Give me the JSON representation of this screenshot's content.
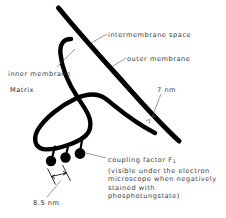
{
  "figure": {
    "background_color": "#ffffff",
    "stroke_color": "#000000",
    "text_color": "#3a3a3c"
  },
  "labels": {
    "intermembrane_space": "intermembrane space",
    "outer_membrane": "outer membrane",
    "inner_membrane": "inner membrane",
    "matrix": "Matrix",
    "seven_nm": "7 nm",
    "eight_five_nm": "8.5 nm"
  },
  "caption": {
    "title_prefix": "coupling factor F",
    "title_subscript": "1",
    "lines": [
      "(visible under the electron",
      "microscope when negatively",
      "stained with",
      "phosphotungstate)"
    ]
  },
  "structures": {
    "outer_membrane_stroke_width": 5.0,
    "inner_membrane_stroke_width": 4.4,
    "coupling_factor_particles": 3,
    "particle_radius": 5.2
  }
}
